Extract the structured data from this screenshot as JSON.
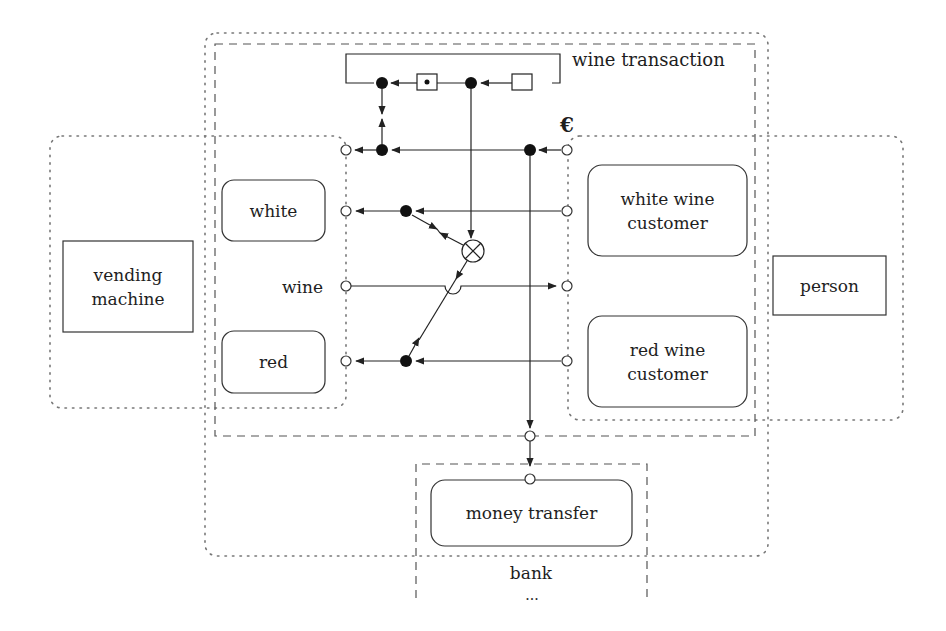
{
  "diagram": {
    "title": "wine transaction",
    "currency_symbol": "€",
    "wine_port_label": "wine",
    "vending_machine": {
      "label_line1": "vending",
      "label_line2": "machine"
    },
    "person": {
      "label": "person"
    },
    "vending_roles": [
      {
        "label": "white"
      },
      {
        "label": "red"
      }
    ],
    "customer_roles": [
      {
        "label_line1": "white wine",
        "label_line2": "customer"
      },
      {
        "label_line1": "red wine",
        "label_line2": "customer"
      }
    ],
    "money_transfer": {
      "label": "money transfer"
    },
    "bank": {
      "label": "bank",
      "ellipsis": "..."
    },
    "colors": {
      "stroke": "#2a2a2a",
      "dotted": "#777777",
      "dashed": "#555555",
      "background": "#ffffff"
    }
  }
}
